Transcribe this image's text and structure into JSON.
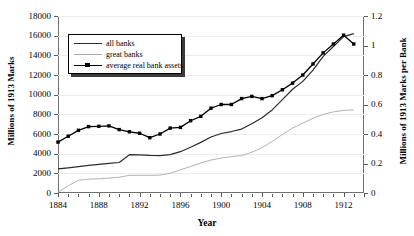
{
  "chart_data": {
    "type": "line",
    "title": "",
    "xlabel": "Year",
    "ylabel": "Millions of 1913 Marks",
    "ylabel_right": "Millions of 1913 Marks per Bank",
    "xlim": [
      1884,
      1914
    ],
    "ylim": [
      0,
      18000
    ],
    "ylim_right": [
      0,
      1.2
    ],
    "grid": true,
    "legend_position": "upper-left-inside",
    "x_tick_labels": [
      "1884",
      "1888",
      "1892",
      "1896",
      "1900",
      "1904",
      "1908",
      "1912"
    ],
    "x_tick_values": [
      1884,
      1888,
      1892,
      1896,
      1900,
      1904,
      1908,
      1912
    ],
    "x_minor_tick_step": 1,
    "y_tick_labels_left": [
      "0",
      "2000",
      "4000",
      "6000",
      "8000",
      "10000",
      "12000",
      "14000",
      "16000",
      "18000"
    ],
    "y_tick_values_left": [
      0,
      2000,
      4000,
      6000,
      8000,
      10000,
      12000,
      14000,
      16000,
      18000
    ],
    "y_tick_labels_right": [
      "0",
      "0.2",
      "0.4",
      "0.6",
      "0.8",
      "1",
      "1.2"
    ],
    "y_tick_values_right": [
      0,
      0.2,
      0.4,
      0.6,
      0.8,
      1.0,
      1.2
    ],
    "x": [
      1884,
      1885,
      1886,
      1887,
      1888,
      1889,
      1890,
      1891,
      1892,
      1893,
      1894,
      1895,
      1896,
      1897,
      1898,
      1899,
      1900,
      1901,
      1902,
      1903,
      1904,
      1905,
      1906,
      1907,
      1908,
      1909,
      1910,
      1911,
      1912,
      1913
    ],
    "series": [
      {
        "name": "all banks",
        "axis": "left",
        "color": "#2b2b2b",
        "marker": "none",
        "values": [
          2450,
          2560,
          2680,
          2800,
          2910,
          3010,
          3100,
          3900,
          3880,
          3820,
          3800,
          3900,
          4200,
          4650,
          5150,
          5700,
          6050,
          6250,
          6500,
          7050,
          7650,
          8450,
          9500,
          10550,
          11350,
          12500,
          13900,
          14900,
          15900,
          16200
        ]
      },
      {
        "name": "great banks",
        "axis": "left",
        "color": "#a9a9a9",
        "marker": "none",
        "values": [
          100,
          720,
          1300,
          1400,
          1450,
          1520,
          1600,
          1800,
          1800,
          1800,
          1820,
          2000,
          2350,
          2700,
          3050,
          3350,
          3550,
          3700,
          3800,
          4150,
          4600,
          5250,
          5950,
          6600,
          7100,
          7600,
          8000,
          8250,
          8400,
          8450
        ]
      },
      {
        "name": "average real bank assets",
        "axis": "right",
        "color": "#000000",
        "marker": "square",
        "values": [
          0.345,
          0.385,
          0.425,
          0.45,
          0.452,
          0.455,
          0.43,
          0.415,
          0.405,
          0.375,
          0.4,
          0.44,
          0.445,
          0.49,
          0.52,
          0.575,
          0.6,
          0.6,
          0.64,
          0.655,
          0.64,
          0.66,
          0.7,
          0.745,
          0.8,
          0.875,
          0.95,
          1.01,
          1.07,
          1.01
        ]
      }
    ]
  },
  "legend": {
    "items": [
      {
        "label": "all banks",
        "style": "thick"
      },
      {
        "label": "great banks",
        "style": "thin"
      },
      {
        "label": "average real bank assets",
        "style": "mark"
      }
    ]
  }
}
